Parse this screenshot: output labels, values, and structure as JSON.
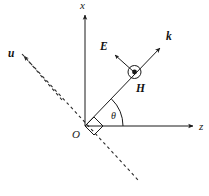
{
  "figure": {
    "background_color": "#ffffff",
    "width": 209,
    "height": 196,
    "line_color": "#1a1a1a",
    "dashed_color": "#2b2b2b"
  },
  "axes": {
    "vertical": {
      "name": "x-axis",
      "label": "x",
      "label_x": 80,
      "label_y": 9,
      "from": {
        "x": 85,
        "y": 126
      },
      "to": {
        "x": 85,
        "y": 13
      },
      "arrow": true
    },
    "horizontal": {
      "name": "z-axis",
      "label": "z",
      "label_x": 199,
      "label_y": 130,
      "from": {
        "x": 85,
        "y": 126
      },
      "to": {
        "x": 195,
        "y": 126
      },
      "arrow": true
    }
  },
  "origin": {
    "label": "O",
    "x": 85,
    "y": 126,
    "label_x": 72,
    "label_y": 138
  },
  "vectors": [
    {
      "name": "k-vector",
      "label": "k",
      "label_x": 166,
      "label_y": 40,
      "from": {
        "x": 85,
        "y": 126
      },
      "to": {
        "x": 162,
        "y": 46
      },
      "style": "solid",
      "arrow": true
    },
    {
      "name": "E-vector",
      "label": "E",
      "label_x": 100,
      "label_y": 50,
      "from": {
        "x": 134,
        "y": 72
      },
      "to": {
        "x": 113,
        "y": 53
      },
      "style": "solid",
      "arrow": true
    },
    {
      "name": "u-vector",
      "label": "u",
      "label_x": 8,
      "label_y": 57,
      "from": {
        "x": 85,
        "y": 126
      },
      "to": {
        "x": 22,
        "y": 54
      },
      "style": "dashed",
      "arrow": true
    }
  ],
  "dashed_line": {
    "name": "u-axis-extension",
    "from": {
      "x": 22,
      "y": 54
    },
    "to": {
      "x": 139,
      "y": 181
    }
  },
  "field_marker": {
    "name": "H-out-of-page",
    "label": "H",
    "label_x": 136,
    "label_y": 92,
    "center_x": 134.5,
    "center_y": 72,
    "outer_radius": 6.5,
    "inner_radius": 2.2,
    "symbol": "dot-in-circle"
  },
  "angle": {
    "name": "theta-angle",
    "label": "θ",
    "label_x": 111,
    "label_y": 119,
    "arc_radius": 38,
    "from_deg": 0,
    "to_deg": 46,
    "vertex": {
      "x": 85,
      "y": 126
    }
  },
  "right_angle": {
    "name": "right-angle-marker",
    "vertex": {
      "x": 85,
      "y": 126
    },
    "size": 13
  }
}
